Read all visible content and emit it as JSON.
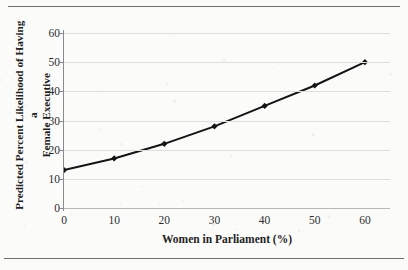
{
  "figure": {
    "background_color": "#fbfbfa",
    "line_color": "#141414",
    "grid_color": "#dededd",
    "axis_color": "#8a8a8a"
  },
  "axis_titles": {
    "x": "Women in Parliament (%)",
    "y_line1": "Predicted Percent Likelihood of Having a",
    "y_line2": "Female Executive"
  },
  "chart_data": {
    "type": "line",
    "title": "",
    "xlabel": "Women in Parliament (%)",
    "ylabel": "Predicted Percent Likelihood of Having a Female Executive",
    "x": [
      0,
      10,
      20,
      30,
      40,
      50,
      60
    ],
    "values": [
      13,
      17,
      22,
      28,
      35,
      42,
      50
    ],
    "series": [
      {
        "name": "Predicted percent likelihood",
        "x": [
          0,
          10,
          20,
          30,
          40,
          50,
          60
        ],
        "values": [
          13,
          17,
          22,
          28,
          35,
          42,
          50
        ]
      }
    ],
    "xlim": [
      0,
      65
    ],
    "ylim": [
      0,
      60
    ],
    "xticks": [
      0,
      10,
      20,
      30,
      40,
      50,
      60
    ],
    "yticks": [
      0,
      10,
      20,
      30,
      40,
      50,
      60
    ],
    "xtick_labels": [
      "0",
      "10",
      "20",
      "30",
      "40",
      "50",
      "60"
    ],
    "ytick_labels": [
      "0",
      "10",
      "20",
      "30",
      "40",
      "50",
      "60"
    ],
    "grid": true,
    "grid_axis": "y",
    "legend": false,
    "marker": "diamond",
    "marker_color": "#141414",
    "line_color": "#141414"
  }
}
